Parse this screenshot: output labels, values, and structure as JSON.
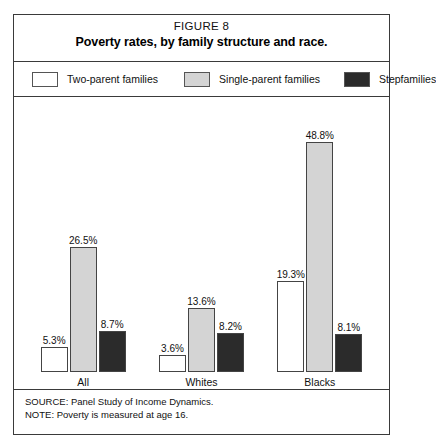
{
  "figure": {
    "number_label": "FIGURE 8",
    "title": "Poverty rates, by family structure and race."
  },
  "legend": {
    "items": [
      {
        "label": "Two-parent families",
        "color": "#ffffff"
      },
      {
        "label": "Single-parent families",
        "color": "#d4d4d4"
      },
      {
        "label": "Stepfamilies",
        "color": "#2b2b2b"
      }
    ]
  },
  "footer": {
    "source": "SOURCE: Panel Study of Income Dynamics.",
    "note": "NOTE: Poverty is measured at age 16."
  },
  "chart_data": {
    "type": "bar",
    "title": "Poverty rates, by family structure and race.",
    "xlabel": "",
    "ylabel": "",
    "ylim": [
      0,
      55
    ],
    "grid": false,
    "legend_position": "top",
    "value_suffix": "%",
    "categories": [
      "All",
      "Whites",
      "Blacks"
    ],
    "series": [
      {
        "name": "Two-parent families",
        "color": "#ffffff",
        "values": [
          5.3,
          3.6,
          19.3
        ],
        "labels": [
          "5.3%",
          "3.6%",
          "19.3%"
        ]
      },
      {
        "name": "Single-parent families",
        "color": "#d4d4d4",
        "values": [
          26.5,
          13.6,
          48.8
        ],
        "labels": [
          "26.5%",
          "13.6%",
          "48.8%"
        ]
      },
      {
        "name": "Stepfamilies",
        "color": "#2b2b2b",
        "values": [
          8.7,
          8.2,
          8.1
        ],
        "labels": [
          "8.7%",
          "8.2%",
          "8.1%"
        ]
      }
    ]
  }
}
